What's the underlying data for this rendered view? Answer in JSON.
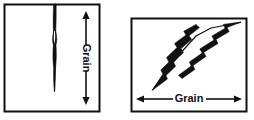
{
  "figure": {
    "background_color": "#ffffff",
    "ink_color": "#111111"
  },
  "panels": [
    {
      "id": "left",
      "name": "split-parallel-to-grain",
      "frame": {
        "x": 4,
        "y": 4,
        "width": 96,
        "height": 108
      },
      "grain_direction": "vertical",
      "arrow": {
        "name": "grain-direction-arrow-vertical",
        "orientation": "vertical",
        "double_headed": true,
        "x": 86,
        "y_top": 12,
        "y_bottom": 104
      },
      "label": {
        "text": "Grain",
        "rotation_deg": 90,
        "x": 86,
        "y": 58
      },
      "crack": {
        "name": "vertical-crack",
        "description": "narrow vertical split running from top edge downward, tapering to a point",
        "start_y": 4,
        "end_y": 92,
        "center_x": 55
      }
    },
    {
      "id": "right",
      "name": "split-across-grain",
      "frame": {
        "x": 131,
        "y": 18,
        "width": 116,
        "height": 94
      },
      "grain_direction": "horizontal",
      "arrow": {
        "name": "grain-direction-arrow-horizontal",
        "orientation": "horizontal",
        "double_headed": true,
        "y": 99,
        "x_left": 136,
        "x_right": 242
      },
      "label": {
        "text": "Grain",
        "rotation_deg": 0,
        "x": 189,
        "y": 99
      },
      "crack": {
        "name": "diagonal-crack",
        "description": "jagged diagonal split running from lower-left to upper-right, crossing the grain",
        "start_x": 152,
        "start_y": 90,
        "end_x": 241,
        "end_y": 22
      }
    }
  ]
}
